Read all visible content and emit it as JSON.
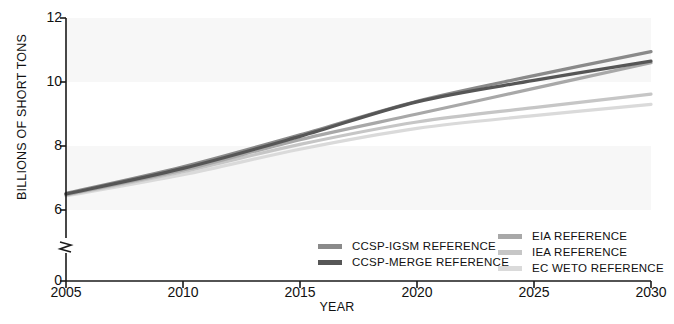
{
  "chart_data": {
    "type": "line",
    "title": "",
    "xlabel": "YEAR",
    "ylabel": "BILLIONS OF SHORT TONS",
    "x": [
      2005,
      2010,
      2015,
      2020,
      2025,
      2030
    ],
    "xlim": [
      2005,
      2030
    ],
    "ylim": [
      6,
      12
    ],
    "y_axis_break": true,
    "y_axis_break_label": "0",
    "yticks": [
      "0",
      "6",
      "8",
      "10",
      "12"
    ],
    "xticks": [
      "2005",
      "2010",
      "2015",
      "2020",
      "2025",
      "2030"
    ],
    "grid": false,
    "banded_background": true,
    "legend_position": "bottom-center",
    "series": [
      {
        "name": "CCSP-IGSM REFERENCE",
        "color": "#8a8a8a",
        "values": [
          6.52,
          7.35,
          8.35,
          9.4,
          10.2,
          10.95
        ]
      },
      {
        "name": "CCSP-MERGE REFERENCE",
        "color": "#565656",
        "values": [
          6.5,
          7.3,
          8.3,
          9.38,
          10.05,
          10.65
        ]
      },
      {
        "name": "EIA REFERENCE",
        "color": "#a8a8a8",
        "values": [
          6.48,
          7.25,
          8.2,
          9.0,
          9.8,
          10.6
        ]
      },
      {
        "name": "IEA REFERENCE",
        "color": "#c6c6c6",
        "values": [
          6.46,
          7.2,
          8.05,
          8.75,
          9.2,
          9.62
        ]
      },
      {
        "name": "EC WETO REFERENCE",
        "color": "#dadada",
        "values": [
          6.44,
          7.1,
          7.9,
          8.55,
          8.95,
          9.3
        ]
      }
    ]
  },
  "axis": {
    "y_label": "BILLIONS OF SHORT TONS",
    "x_label": "YEAR"
  },
  "legend": {
    "left_column": [
      {
        "label": "CCSP-IGSM REFERENCE",
        "color": "#8a8a8a"
      },
      {
        "label": "CCSP-MERGE REFERENCE",
        "color": "#565656"
      }
    ],
    "right_column": [
      {
        "label": "EIA REFERENCE",
        "color": "#a8a8a8"
      },
      {
        "label": "IEA REFERENCE",
        "color": "#c6c6c6"
      },
      {
        "label": "EC WETO REFERENCE",
        "color": "#dadada"
      }
    ]
  }
}
